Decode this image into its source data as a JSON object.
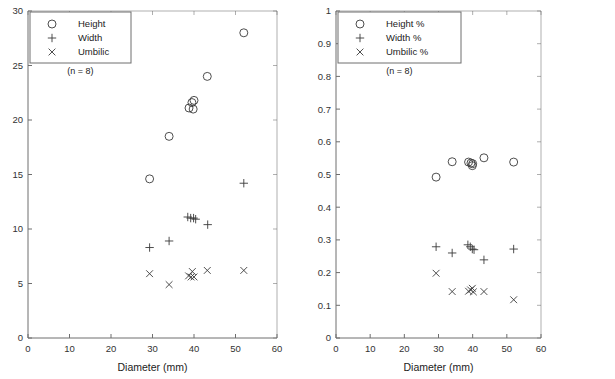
{
  "figure": {
    "panels": [
      "left",
      "right"
    ],
    "background": "#ffffff",
    "marker_color": "#3a3a3a",
    "axis_color": "#6e6e6e"
  },
  "left_panel": {
    "n_label": "(n = 8)",
    "xlabel": "Diameter (mm)",
    "legend": [
      {
        "marker": "circle-marker",
        "label": "Height"
      },
      {
        "marker": "plus-marker",
        "label": "Width"
      },
      {
        "marker": "cross-marker",
        "label": "Umbilic"
      }
    ],
    "xticks": [
      "0",
      "10",
      "20",
      "30",
      "40",
      "50",
      "60"
    ],
    "yticks": [
      "0",
      "5",
      "10",
      "15",
      "20",
      "25",
      "30"
    ]
  },
  "right_panel": {
    "n_label": "(n = 8)",
    "xlabel": "Diameter (mm)",
    "legend": [
      {
        "marker": "circle-marker",
        "label": "Height %"
      },
      {
        "marker": "plus-marker",
        "label": "Width %"
      },
      {
        "marker": "cross-marker",
        "label": "Umbilic %"
      }
    ],
    "xticks": [
      "0",
      "10",
      "20",
      "30",
      "40",
      "50",
      "60"
    ],
    "yticks": [
      "0",
      "0.1",
      "0.2",
      "0.3",
      "0.4",
      "0.5",
      "0.6",
      "0.7",
      "0.8",
      "0.9",
      "1"
    ]
  },
  "chart_data": [
    {
      "type": "scatter",
      "title": "",
      "xlabel": "Diameter (mm)",
      "ylabel": "",
      "xlim": [
        0,
        60
      ],
      "ylim": [
        0,
        30
      ],
      "xticks": [
        0,
        10,
        20,
        30,
        40,
        50,
        60
      ],
      "yticks": [
        0,
        5,
        10,
        15,
        20,
        25,
        30
      ],
      "grid": false,
      "legend_position": "upper-left",
      "annotations": [
        "(n = 8)"
      ],
      "series": [
        {
          "name": "Height",
          "marker": "circle",
          "points": [
            [
              29.3,
              14.6
            ],
            [
              34.0,
              18.5
            ],
            [
              38.8,
              21.1
            ],
            [
              39.5,
              21.6
            ],
            [
              40.0,
              21.8
            ],
            [
              39.8,
              21.0
            ],
            [
              43.2,
              24.0
            ],
            [
              52.0,
              28.0
            ]
          ]
        },
        {
          "name": "Width",
          "marker": "plus",
          "points": [
            [
              29.3,
              8.3
            ],
            [
              34.0,
              8.9
            ],
            [
              38.5,
              11.1
            ],
            [
              39.2,
              11.0
            ],
            [
              39.9,
              11.0
            ],
            [
              40.4,
              10.9
            ],
            [
              43.3,
              10.4
            ],
            [
              52.0,
              14.2
            ]
          ]
        },
        {
          "name": "Umbilic",
          "marker": "cross",
          "points": [
            [
              29.3,
              5.9
            ],
            [
              34.0,
              4.9
            ],
            [
              38.7,
              5.7
            ],
            [
              39.3,
              5.6
            ],
            [
              39.6,
              6.1
            ],
            [
              40.0,
              5.6
            ],
            [
              43.2,
              6.2
            ],
            [
              52.0,
              6.2
            ]
          ]
        }
      ]
    },
    {
      "type": "scatter",
      "title": "",
      "xlabel": "Diameter (mm)",
      "ylabel": "",
      "xlim": [
        0,
        60
      ],
      "ylim": [
        0,
        1
      ],
      "xticks": [
        0,
        10,
        20,
        30,
        40,
        50,
        60
      ],
      "yticks": [
        0,
        0.1,
        0.2,
        0.3,
        0.4,
        0.5,
        0.6,
        0.7,
        0.8,
        0.9,
        1
      ],
      "grid": false,
      "legend_position": "upper-left",
      "annotations": [
        "(n = 8)"
      ],
      "series": [
        {
          "name": "Height %",
          "marker": "circle",
          "points": [
            [
              29.3,
              0.492
            ],
            [
              34.0,
              0.539
            ],
            [
              38.8,
              0.538
            ],
            [
              39.5,
              0.535
            ],
            [
              40.0,
              0.533
            ],
            [
              39.9,
              0.527
            ],
            [
              43.3,
              0.551
            ],
            [
              52.0,
              0.538
            ]
          ]
        },
        {
          "name": "Width %",
          "marker": "plus",
          "points": [
            [
              29.3,
              0.279
            ],
            [
              34.0,
              0.26
            ],
            [
              38.6,
              0.285
            ],
            [
              39.3,
              0.279
            ],
            [
              39.9,
              0.272
            ],
            [
              40.4,
              0.27
            ],
            [
              43.3,
              0.239
            ],
            [
              52.0,
              0.272
            ]
          ]
        },
        {
          "name": "Umbilic %",
          "marker": "cross",
          "points": [
            [
              29.3,
              0.198
            ],
            [
              34.0,
              0.142
            ],
            [
              38.8,
              0.143
            ],
            [
              39.4,
              0.147
            ],
            [
              39.9,
              0.152
            ],
            [
              40.2,
              0.141
            ],
            [
              43.3,
              0.142
            ],
            [
              52.0,
              0.117
            ]
          ]
        }
      ]
    }
  ]
}
